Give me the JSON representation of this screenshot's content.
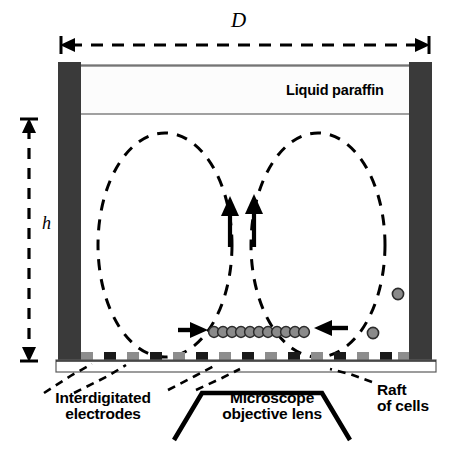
{
  "figure": {
    "type": "schematic-diagram",
    "labels": {
      "width_dimension": "D",
      "height_dimension": "h",
      "top_layer": "Liquid paraffin",
      "electrodes": "Interdigitated\nelectrodes",
      "objective": "Microscope\nobjective lens",
      "raft": "Raft\nof cells"
    },
    "colors": {
      "wall": "#3a3a3a",
      "outline": "#000000",
      "paraffin_fill": "#fbfbfb",
      "cell_fill": "#8a8a8a",
      "cell_stroke": "#2b2b2b",
      "background": "#ffffff"
    },
    "geometry": {
      "chamber_left": 58,
      "chamber_right": 432,
      "chamber_top": 62,
      "chamber_bottom": 360,
      "wall_thickness": 22,
      "paraffin_top": 66,
      "paraffin_bottom": 114,
      "slide_top": 360,
      "slide_bottom": 372
    },
    "elements": {
      "vortex_count": 2,
      "vortex_direction": [
        "clockwise",
        "counter-clockwise"
      ],
      "center_up_arrows": 2,
      "inward_arrows": 2,
      "raft_cell_count": 11,
      "free_cell_count": 2,
      "electrode_count": 15
    }
  }
}
